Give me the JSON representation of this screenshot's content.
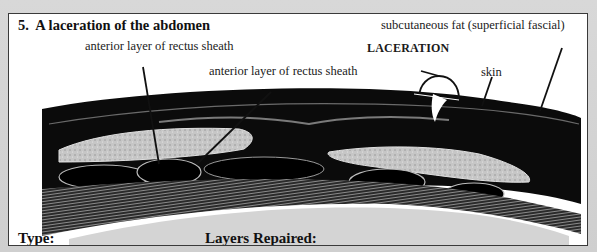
{
  "question": {
    "number": "5.",
    "title": "A laceration of the abdomen"
  },
  "labels": {
    "anterior_rectus_sheath_1": "anterior layer of rectus sheath",
    "anterior_rectus_sheath_2": "anterior layer of rectus sheath",
    "subcutaneous_fat": "subcutaneous fat (superficial fascial)",
    "laceration": "LACERATION",
    "skin": "skin"
  },
  "form": {
    "type_label": "Type:",
    "type_value": "",
    "layers_label": "Layers Repaired:",
    "layers_value": ""
  },
  "colors": {
    "border": "#3a3a3a",
    "tissue_dark": "#0a0a0a",
    "muscle_light": "#c8c8c8",
    "background": "#ffffff"
  }
}
